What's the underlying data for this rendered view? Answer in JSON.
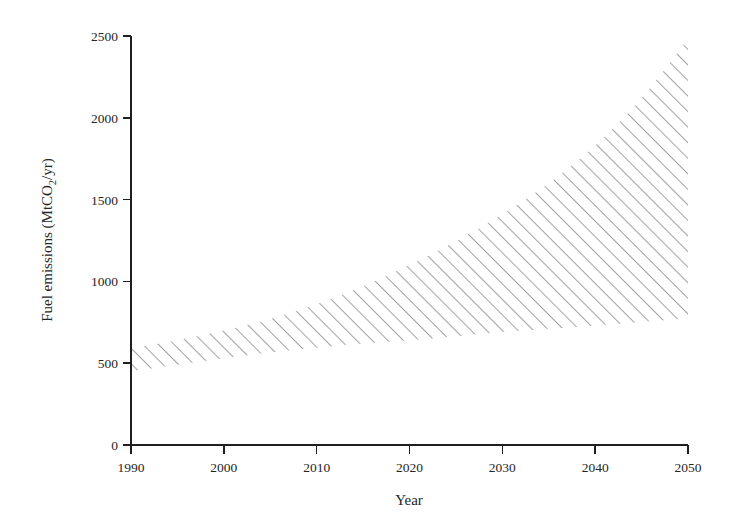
{
  "chart_data": {
    "type": "area",
    "title": "",
    "subtitle": "",
    "xlabel": "Year",
    "ylabel": "Fuel emissions (MtCO2/yr)",
    "ylabel_parts": {
      "prefix": "Fuel emissions (MtCO",
      "subscript": "2",
      "suffix": "/yr)"
    },
    "xlim": [
      1990,
      2050
    ],
    "ylim": [
      0,
      2500
    ],
    "grid": false,
    "legend": null,
    "x_ticks": [
      1990,
      2000,
      2010,
      2020,
      2030,
      2040,
      2050
    ],
    "x_tick_labels": [
      "1990",
      "2000",
      "2010",
      "2020",
      "2030",
      "2040",
      "2050"
    ],
    "y_ticks": [
      0,
      500,
      1000,
      1500,
      2000,
      2500
    ],
    "y_tick_labels": [
      "0",
      "500",
      "1000",
      "1500",
      "2000",
      "2500"
    ],
    "fill_style": "diagonal-hatch",
    "fill_color": "#3a3a3a",
    "x": [
      1990,
      1995,
      2000,
      2005,
      2010,
      2015,
      2020,
      2025,
      2030,
      2035,
      2040,
      2045,
      2050
    ],
    "series": [
      {
        "name": "Upper bound",
        "values": [
          590,
          640,
          700,
          770,
          860,
          970,
          1100,
          1245,
          1410,
          1600,
          1830,
          2120,
          2480
        ]
      },
      {
        "name": "Lower bound",
        "values": [
          450,
          490,
          530,
          565,
          595,
          620,
          640,
          665,
          690,
          710,
          730,
          752,
          775
        ]
      }
    ],
    "band": {
      "description": "Shaded uncertainty range between lower and upper emission projections",
      "start_year": 1990,
      "end_year": 2050,
      "start_range": [
        450,
        590
      ],
      "end_range": [
        775,
        2480
      ]
    }
  },
  "geometry": {
    "plot_left": 131,
    "plot_right": 688,
    "plot_bottom": 445,
    "plot_top": 36
  }
}
